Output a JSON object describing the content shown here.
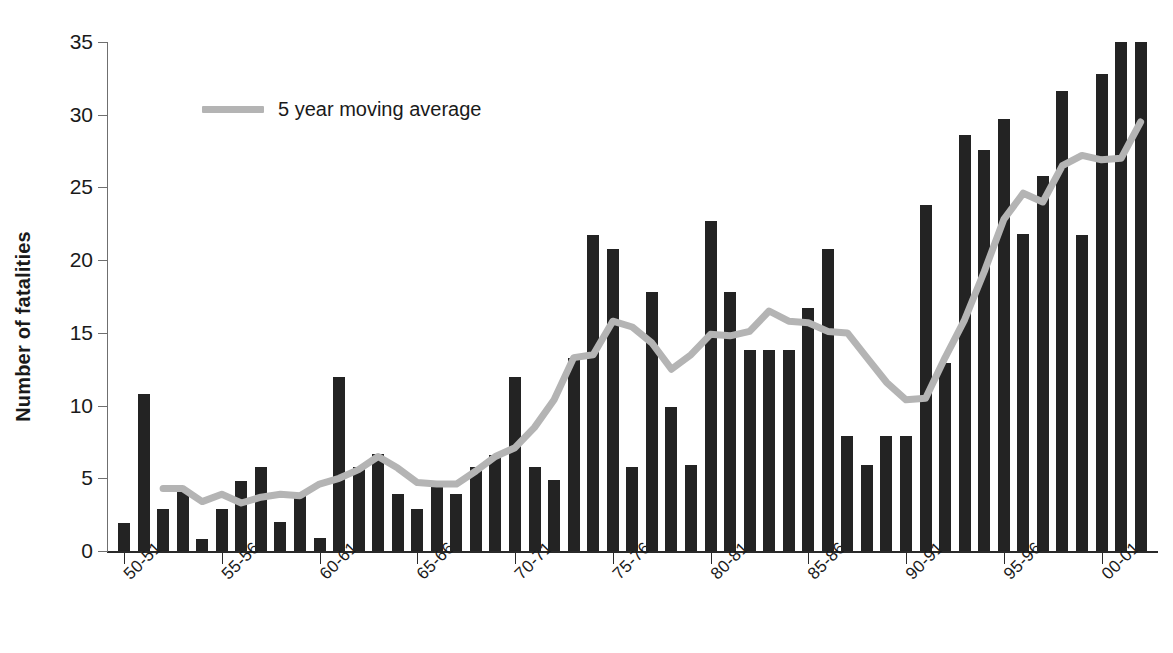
{
  "chart_data": {
    "type": "bar",
    "title": "",
    "subtitle": "",
    "xlabel": "",
    "ylabel": "Number of fatalities",
    "ylim": [
      0,
      35
    ],
    "yticks": [
      0,
      5,
      10,
      15,
      20,
      25,
      30,
      35
    ],
    "grid": false,
    "legend_position": "top-left",
    "bar_color": "#232323",
    "line_color": "#b4b4b4",
    "categories": [
      "50-51",
      "51-52",
      "52-53",
      "53-54",
      "54-55",
      "55-56",
      "56-57",
      "57-58",
      "58-59",
      "59-60",
      "60-61",
      "61-62",
      "62-63",
      "63-64",
      "64-65",
      "65-66",
      "66-67",
      "67-68",
      "68-69",
      "69-70",
      "70-71",
      "71-72",
      "72-73",
      "73-74",
      "74-75",
      "75-76",
      "76-77",
      "77-78",
      "78-79",
      "79-80",
      "80-81",
      "81-82",
      "82-83",
      "83-84",
      "84-85",
      "85-86",
      "86-87",
      "87-88",
      "88-89",
      "89-90",
      "90-91",
      "91-92",
      "92-93",
      "93-94",
      "94-95",
      "95-96",
      "96-97",
      "97-98",
      "98-99",
      "99-00",
      "00-01",
      "01-02",
      "02-03"
    ],
    "tick_labels": [
      "50-51",
      "55-56",
      "60-61",
      "65-66",
      "70-71",
      "75-76",
      "80-81",
      "85-86",
      "90-91",
      "95-96",
      "00-01"
    ],
    "tick_indices": [
      0,
      5,
      10,
      15,
      20,
      25,
      30,
      35,
      40,
      45,
      50
    ],
    "series": [
      {
        "name": "Number of fatalities",
        "type": "bar",
        "values": [
          1.9,
          10.8,
          2.9,
          4.2,
          0.8,
          2.9,
          4.8,
          5.8,
          2.0,
          3.9,
          0.9,
          12.0,
          5.8,
          6.7,
          3.9,
          2.9,
          4.5,
          3.9,
          5.8,
          6.6,
          12.0,
          5.8,
          4.9,
          13.3,
          21.7,
          20.8,
          5.8,
          17.8,
          9.9,
          5.9,
          22.7,
          17.8,
          13.8,
          13.8,
          13.8,
          16.7,
          20.8,
          7.9,
          5.9,
          7.9,
          7.9,
          23.8,
          12.9,
          28.6,
          27.6,
          29.7,
          21.8,
          25.8,
          31.6,
          21.7,
          32.8,
          35.0,
          35.0
        ]
      },
      {
        "name": "5 year moving average",
        "type": "line",
        "values": [
          null,
          null,
          4.3,
          4.3,
          3.4,
          3.9,
          3.3,
          3.7,
          3.9,
          3.8,
          4.6,
          5.0,
          5.6,
          6.5,
          5.7,
          4.7,
          4.6,
          4.6,
          5.5,
          6.5,
          7.1,
          8.5,
          10.4,
          13.3,
          13.5,
          15.8,
          15.4,
          14.3,
          12.5,
          13.5,
          14.9,
          14.8,
          15.1,
          16.5,
          15.8,
          15.7,
          15.1,
          15.0,
          13.3,
          11.6,
          10.4,
          10.5,
          13.3,
          15.9,
          19.2,
          22.8,
          24.6,
          24.0,
          26.5,
          27.2,
          26.9,
          27.0,
          29.5
        ]
      }
    ]
  },
  "legend": {
    "label": "5 year moving average",
    "swatch_name": "moving-average-line-swatch"
  },
  "axes": {
    "y_title": "Number of fatalities"
  }
}
